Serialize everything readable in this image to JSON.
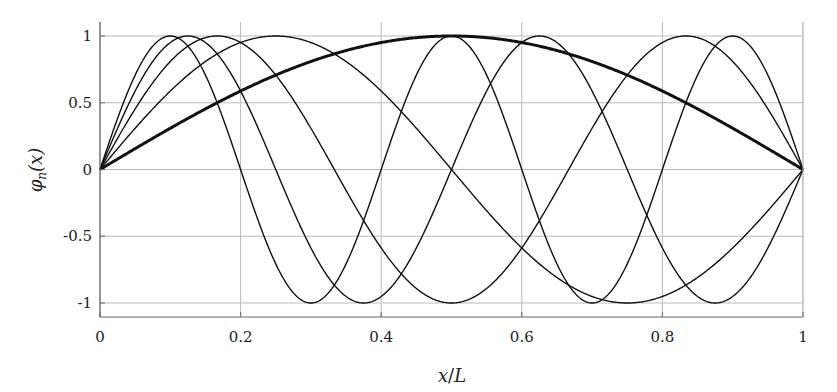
{
  "chart_data": {
    "type": "line",
    "title": "",
    "xlabel": "x/L",
    "ylabel": "φ_n(x)",
    "xlim": [
      0,
      1
    ],
    "ylim": [
      -1.1,
      1.1
    ],
    "grid": true,
    "legend": null,
    "x_ticks": [
      "0",
      "0.2",
      "0.4",
      "0.6",
      "0.8",
      "1"
    ],
    "y_ticks": [
      "1",
      "0.5",
      "0",
      "-0.5",
      "-1"
    ],
    "function": "sin(n*pi*x)",
    "series": [
      {
        "name": "n=1",
        "n": 1,
        "line_width": 3,
        "peaks_at": [
          0.5
        ]
      },
      {
        "name": "n=2",
        "n": 2,
        "line_width": 1.4,
        "peaks_at": [
          0.25,
          0.75
        ]
      },
      {
        "name": "n=3",
        "n": 3,
        "line_width": 1.4,
        "peaks_at": [
          0.1667,
          0.5,
          0.8333
        ]
      },
      {
        "name": "n=4",
        "n": 4,
        "line_width": 1.4,
        "peaks_at": [
          0.125,
          0.375,
          0.625,
          0.875
        ]
      },
      {
        "name": "n=5",
        "n": 5,
        "line_width": 1.4,
        "peaks_at": [
          0.1,
          0.3,
          0.5,
          0.7,
          0.9
        ]
      }
    ]
  },
  "axes": {
    "x_label_main": "x",
    "x_label_slash": "/",
    "x_label_denom": "L",
    "y_label_phi": "φ",
    "y_label_sub": "n",
    "y_label_arg": "(x)"
  },
  "colors": {
    "line": "#111111",
    "grid": "#bbbbbb",
    "axis": "#666666"
  }
}
